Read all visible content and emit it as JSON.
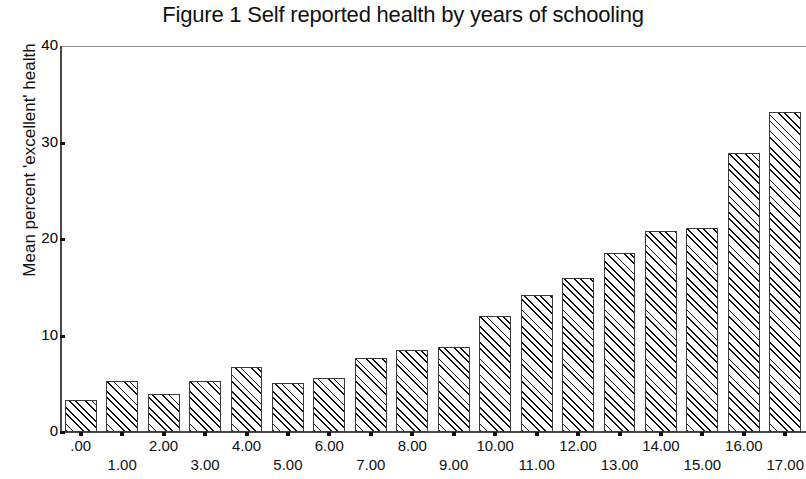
{
  "figure": {
    "title": "Figure 1 Self reported health by years of schooling",
    "y_axis_label": "Mean percent 'excellent' health"
  },
  "chart_data": {
    "type": "bar",
    "title": "Figure 1 Self reported health by years of schooling",
    "xlabel": "",
    "ylabel": "Mean percent 'excellent' health",
    "categories": [
      ".00",
      "1.00",
      "2.00",
      "3.00",
      "4.00",
      "5.00",
      "6.00",
      "7.00",
      "8.00",
      "9.00",
      "10.00",
      "11.00",
      "12.00",
      "13.00",
      "14.00",
      "15.00",
      "16.00",
      "17.00"
    ],
    "values": [
      3.3,
      5.3,
      3.9,
      5.3,
      6.7,
      5.1,
      5.6,
      7.7,
      8.5,
      8.8,
      12.0,
      14.2,
      16.0,
      18.6,
      20.8,
      21.1,
      28.9,
      33.2
    ],
    "ylim": [
      0,
      40
    ],
    "yticks": [
      0,
      10,
      20,
      30,
      40
    ],
    "ytick_labels": [
      "0",
      "10",
      "20",
      "30",
      "40"
    ],
    "grid": false,
    "legend": null,
    "bar_style": {
      "fill": "#ffffff",
      "edge_color": "#3a3a3a",
      "hatch": "diagonal-45"
    }
  }
}
